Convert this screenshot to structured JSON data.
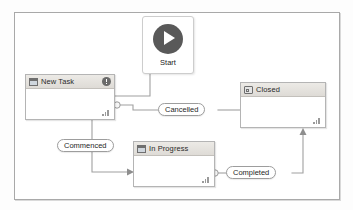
{
  "diagram": {
    "frame_color": "#a9a9a9",
    "accent_color": "#595959"
  },
  "start": {
    "label": "Start",
    "icon": "play-circle-icon"
  },
  "nodes": [
    {
      "id": "new-task",
      "label": "New Task",
      "icon": "window-icon",
      "badge_icon": "warning-exclamation-icon",
      "grip_icon": "resize-grip-icon"
    },
    {
      "id": "closed",
      "label": "Closed",
      "icon": "closed-box-icon",
      "grip_icon": "resize-grip-icon"
    },
    {
      "id": "in-progress",
      "label": "In Progress",
      "icon": "window-icon",
      "grip_icon": "resize-grip-icon"
    }
  ],
  "transitions": [
    {
      "id": "cancelled",
      "label": "Cancelled",
      "from": "new-task",
      "to": "closed"
    },
    {
      "id": "commenced",
      "label": "Commenced",
      "from": "new-task",
      "to": "in-progress"
    },
    {
      "id": "completed",
      "label": "Completed",
      "from": "in-progress",
      "to": "closed"
    }
  ]
}
